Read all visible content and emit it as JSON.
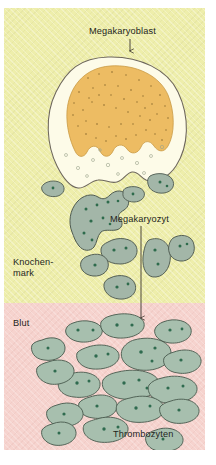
{
  "figure": {
    "width": 216,
    "height": 465
  },
  "regions": {
    "marrow": {
      "label": "Knochen-\nmark",
      "label_line1": "Knochen-",
      "label_line2": "mark",
      "color": "#eeeeab"
    },
    "blood": {
      "label": "Blut",
      "color": "#f6d3ce"
    }
  },
  "labels": {
    "megakaryoblast": "Megakaryoblast",
    "megakaryozyt": "Megakaryozyt",
    "thrombozyten": "Thrombozyten"
  },
  "colors": {
    "marrow_background": "#eeeeab",
    "blood_background": "#f6d3ce",
    "cytoplasm": "#fbf8e0",
    "nucleus_orange": "#eebc62",
    "nucleus_orange_speck": "#8a6a2a",
    "platelet_fill": "#a8bfae",
    "platelet_outline": "#4d5f52",
    "platelet_granule": "#2f6b4f",
    "megakaryocyte_fill": "#9fb2a6",
    "outline": "#55504a",
    "text": "#231f1c",
    "arrow": "#3a332c"
  },
  "arrows": [
    {
      "name": "megakaryoblast-arrow",
      "from": "Megakaryoblast label",
      "to": "Megakaryoblast cell"
    },
    {
      "name": "megakaryozyt-arrow",
      "from": "Megakaryozyt label",
      "to": "Thrombozyten in Blut"
    }
  ],
  "cells": {
    "megakaryoblast": {
      "count": 1,
      "description": "large cell with lobed orange nucleus and pale cytoplasm"
    },
    "megakaryocyte": {
      "count": 1,
      "description": "grey-green multilobed cell shedding platelets"
    },
    "platelets_marrow": {
      "count": 5
    },
    "platelets_blood": {
      "count": 24
    }
  }
}
